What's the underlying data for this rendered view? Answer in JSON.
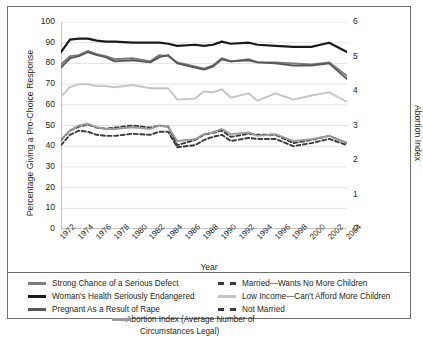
{
  "axes": {
    "y_left_title": "Percentage Giving a Pro-Choice Response",
    "y_right_title": "Abortion Index",
    "x_title": "Year",
    "y_left_ticks": [
      "100",
      "90",
      "80",
      "70",
      "60",
      "50",
      "40",
      "30",
      "20",
      "10",
      "0"
    ],
    "y_right_ticks": [
      "6",
      "5",
      "4",
      "3",
      "2",
      "1",
      "0"
    ],
    "x_ticks": [
      "1972",
      "1974",
      "1976",
      "1978",
      "1980",
      "1982",
      "1984",
      "1986",
      "1988",
      "1990",
      "1992",
      "1994",
      "1996",
      "1998",
      "2000",
      "2002",
      "2004"
    ]
  },
  "legend": {
    "left": [
      {
        "label": "Strong Chance of a Serious Defect",
        "color": "#7c7c7c",
        "style": "solid"
      },
      {
        "label": "Woman's Health Seriously Endangered",
        "color": "#1a1a1a",
        "style": "solid"
      },
      {
        "label": "Pregnant As a Result of Rape",
        "color": "#585858",
        "style": "solid"
      }
    ],
    "right": [
      {
        "label": "Married—Wants No More Children",
        "color": "#3a3a3a",
        "style": "dashed"
      },
      {
        "label": "Low Income—Can't Afford More Children",
        "color": "#c4c4c4",
        "style": "solid"
      },
      {
        "label": "Not Married",
        "color": "#3a3a3a",
        "style": "dashed"
      }
    ],
    "center": {
      "line1": "Abortion Index (Average Number of",
      "line2": "Circumstances Legal)",
      "color": "#9a9a9a",
      "style": "solid"
    }
  },
  "chart_data": {
    "type": "line",
    "title": "",
    "xlabel": "Year",
    "ylabel": "Percentage Giving a Pro-Choice Response",
    "y2label": "Abortion Index",
    "ylim": [
      0,
      100
    ],
    "y2lim": [
      0,
      6
    ],
    "xlim": [
      1972,
      2004
    ],
    "grid": true,
    "legend_position": "below",
    "x": [
      1972,
      1973,
      1974,
      1975,
      1976,
      1977,
      1978,
      1980,
      1982,
      1983,
      1984,
      1985,
      1987,
      1988,
      1989,
      1990,
      1991,
      1993,
      1994,
      1996,
      1998,
      2000,
      2002,
      2004
    ],
    "series": [
      {
        "name": "Woman's Health Seriously Endangered",
        "color": "#1a1a1a",
        "style": "solid",
        "axis": "left",
        "values": [
          85.5,
          91.5,
          92,
          92,
          91,
          90.5,
          90.5,
          90,
          90,
          90,
          89.5,
          88.5,
          89,
          88.5,
          89,
          90.5,
          89.5,
          90,
          89,
          88.5,
          88,
          88,
          90,
          85.5
        ]
      },
      {
        "name": "Strong Chance of a Serious Defect",
        "color": "#7c7c7c",
        "style": "solid",
        "axis": "left",
        "values": [
          79.5,
          83.5,
          84,
          86,
          84.5,
          83.5,
          82,
          82.5,
          81,
          84,
          83.5,
          80.5,
          78.5,
          77.5,
          79,
          82.5,
          81,
          82,
          80.5,
          80.5,
          80,
          79.5,
          80.5,
          74
        ]
      },
      {
        "name": "Pregnant As a Result of Rape",
        "color": "#585858",
        "style": "solid",
        "axis": "left",
        "values": [
          78,
          82.5,
          83.5,
          85.5,
          84,
          83,
          81,
          81.5,
          80.5,
          83,
          84,
          80,
          78,
          77,
          78.5,
          82,
          81,
          81.5,
          80.5,
          80,
          79,
          79,
          80,
          72.5
        ]
      },
      {
        "name": "Low Income—Can't Afford More Children",
        "color": "#c4c4c4",
        "style": "solid",
        "axis": "left",
        "values": [
          64,
          68.5,
          70,
          70,
          69,
          69,
          68.5,
          69.5,
          68,
          68,
          68,
          62.5,
          63,
          66.5,
          66,
          67.5,
          63.5,
          65.5,
          62,
          65.5,
          62.5,
          64.5,
          66,
          61.5
        ]
      },
      {
        "name": "Married—Wants No More Children",
        "color": "#3a3a3a",
        "style": "dashed",
        "axis": "left",
        "values": [
          43,
          47.5,
          49.5,
          50.5,
          49,
          48.5,
          49,
          50,
          49,
          50,
          49.5,
          40.5,
          43,
          45.5,
          46.5,
          47.5,
          44.5,
          46,
          45.5,
          45.5,
          41.5,
          43,
          45,
          41.5
        ]
      },
      {
        "name": "Not Married",
        "color": "#3a3a3a",
        "style": "dashed",
        "axis": "left",
        "values": [
          40.5,
          45.5,
          47.5,
          47,
          45.5,
          45,
          45,
          46,
          45.5,
          47,
          47,
          39.5,
          40.5,
          43,
          44.5,
          45.5,
          42.5,
          44,
          43.5,
          43.5,
          40,
          41.5,
          43.5,
          40.5
        ]
      },
      {
        "name": "Abortion Index (Average Number of Circumstances Legal)",
        "color": "#9a9a9a",
        "style": "solid",
        "axis": "right",
        "values": [
          2.6,
          2.85,
          3.0,
          3.05,
          2.95,
          2.9,
          2.9,
          2.95,
          2.9,
          3.0,
          2.95,
          2.55,
          2.6,
          2.75,
          2.8,
          2.9,
          2.75,
          2.8,
          2.7,
          2.75,
          2.55,
          2.6,
          2.7,
          2.5
        ]
      }
    ]
  }
}
